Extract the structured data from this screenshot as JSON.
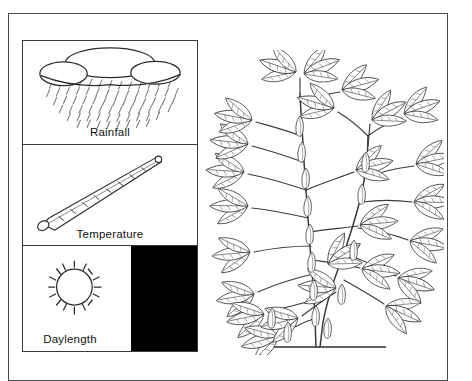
{
  "figure": {
    "background_color": "#ffffff",
    "border_color": "#4a4a4a"
  },
  "legend": {
    "panels": [
      {
        "id": "rainfall",
        "label": "Rainfall",
        "icon": "rain-cloud-icon",
        "description": "Outline cloud with diagonal rain streaks beneath"
      },
      {
        "id": "temperature",
        "label": "Temperature",
        "icon": "thermometer-icon",
        "description": "Diagonal thermometer with graduation tick marks and bulb"
      },
      {
        "id": "daylength",
        "label": "Daylength",
        "icon": "sun-moon-icon",
        "description": "Sun with rays on white field beside crescent moon on black field",
        "day_background": "#ffffff",
        "night_background": "#000000"
      }
    ]
  },
  "illustration": {
    "id": "legume-plant",
    "name": "Soybean plant line drawing",
    "description": "Botanical ink line drawing of a branching legume plant with trifoliate leaves, pods and a ground line at the stem base",
    "ground_line": true
  }
}
